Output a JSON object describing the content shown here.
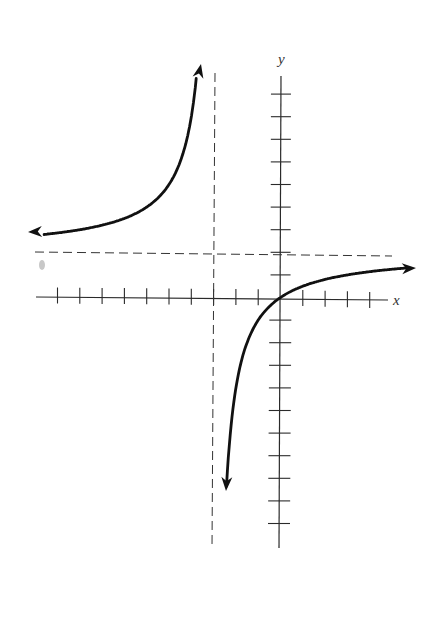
{
  "chart_data": {
    "type": "line",
    "title": "",
    "xlabel": "x",
    "ylabel": "y",
    "function": "y = 2x / (x + 3)",
    "xlim": [
      -10,
      4
    ],
    "ylim": [
      -10,
      9
    ],
    "grid": false,
    "x_ticks_left": 10,
    "x_ticks_right": 4,
    "y_ticks_up": 9,
    "y_ticks_down": 10,
    "asymptotes": {
      "vertical": {
        "x": -3,
        "style": "dashed"
      },
      "horizontal": {
        "y": 2,
        "style": "dashed"
      }
    },
    "series": [
      {
        "name": "left-branch",
        "x": [
          -10.8,
          -10,
          -9,
          -8,
          -7,
          -6,
          -5,
          -4.5,
          -4,
          -3.8,
          -3.73
        ],
        "y": [
          2.77,
          2.86,
          3.0,
          3.2,
          3.5,
          4.0,
          5.0,
          6.0,
          8.0,
          9.5,
          10.2
        ],
        "arrows": [
          "left",
          "up"
        ]
      },
      {
        "name": "right-branch",
        "x": [
          -2.43,
          -2.3,
          -2,
          -1.5,
          -1,
          0,
          1,
          2,
          3,
          4,
          6
        ],
        "y": [
          -8.5,
          -6.57,
          -4.0,
          -2.0,
          -1.0,
          0.0,
          0.5,
          0.8,
          1.0,
          1.14,
          1.33
        ],
        "arrows": [
          "down",
          "right"
        ]
      }
    ]
  },
  "labels": {
    "x_axis": "x",
    "y_axis": "y"
  }
}
